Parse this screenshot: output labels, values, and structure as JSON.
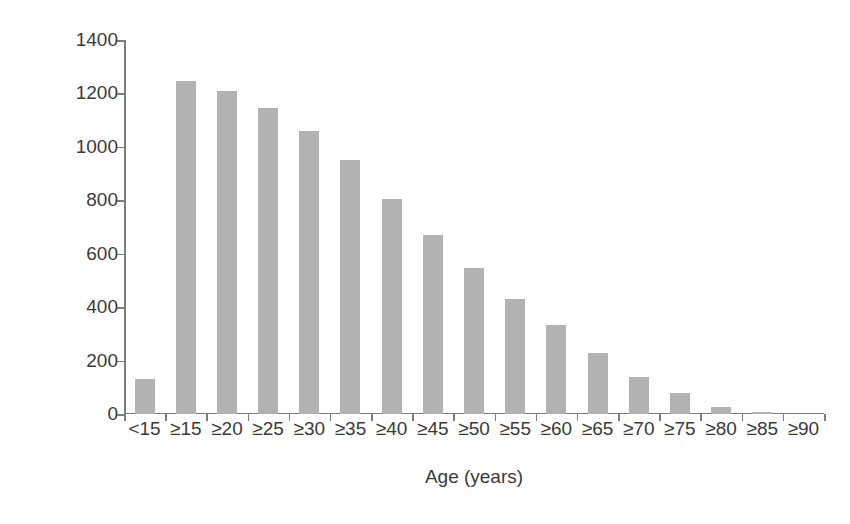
{
  "chart_data": {
    "type": "bar",
    "title": "",
    "subtitle": "",
    "xlabel": "Age (years)",
    "ylabel": "Number of patients",
    "categories": [
      "<15",
      "≥15",
      "≥20",
      "≥25",
      "≥30",
      "≥35",
      "≥40",
      "≥45",
      "≥50",
      "≥55",
      "≥60",
      "≥65",
      "≥70",
      "≥75",
      "≥80",
      "≥85",
      "≥90"
    ],
    "values": [
      130,
      1245,
      1210,
      1145,
      1060,
      950,
      805,
      670,
      545,
      430,
      335,
      230,
      138,
      78,
      25,
      8,
      0
    ],
    "ylim": [
      0,
      1400
    ],
    "yticks": [
      0,
      200,
      400,
      600,
      800,
      1000,
      1200,
      1400
    ],
    "ytick_labels": [
      "0",
      "200",
      "400",
      "600",
      "800",
      "1000",
      "1200",
      "1400"
    ],
    "grid": false,
    "legend": null,
    "legend_position": "none",
    "bar_color": "#b2b2b2",
    "axis_color": "#7d7d7d",
    "text_color": "#3a3a3a",
    "background_color": "#ffffff"
  }
}
